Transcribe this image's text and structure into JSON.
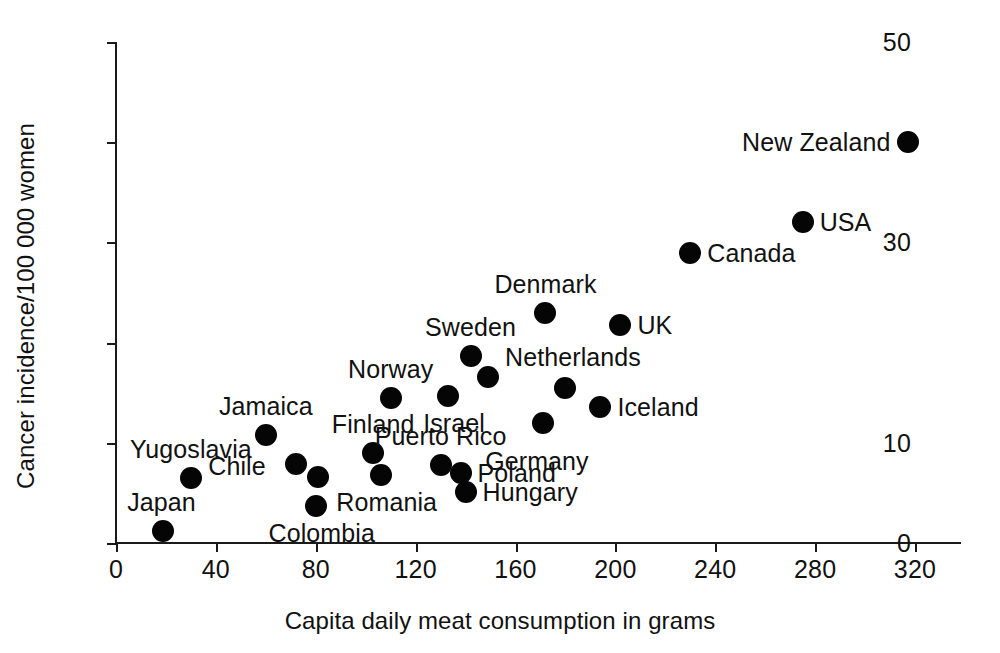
{
  "chart_data": {
    "type": "scatter",
    "title": "",
    "xlabel": "Capita daily meat consumption in grams",
    "ylabel": "Cancer incidence/100 000 women",
    "xlim": [
      0,
      330
    ],
    "ylim": [
      0,
      50
    ],
    "xticks": [
      0,
      40,
      80,
      120,
      160,
      200,
      240,
      280,
      320
    ],
    "xtick_labels": [
      "0",
      "40",
      "80",
      "120",
      "160",
      "200",
      "240",
      "280",
      "320"
    ],
    "yticks": [
      0,
      10,
      20,
      30,
      40,
      50
    ],
    "ytick_labels": [
      "0",
      "10",
      "",
      "30",
      "",
      "50"
    ],
    "grid": false,
    "legend": false,
    "marker": "filled-circle",
    "marker_color": "#050505",
    "axis_color": "#1a1a1a",
    "background": "#ffffff",
    "points": [
      {
        "label": "Japan",
        "x": 19,
        "y": 1.2,
        "label_pos": "above-left"
      },
      {
        "label": "Yugoslavia",
        "x": 30,
        "y": 6.5,
        "label_pos": "above"
      },
      {
        "label": "Jamaica",
        "x": 60,
        "y": 10.8,
        "label_pos": "above"
      },
      {
        "label": "Chile",
        "x": 72,
        "y": 7.9,
        "label_pos": "below-left"
      },
      {
        "label": "",
        "x": 81,
        "y": 6.6,
        "label_pos": "none"
      },
      {
        "label": "Colombia",
        "x": 80,
        "y": 3.7,
        "label_pos": "below"
      },
      {
        "label": "Finland",
        "x": 103,
        "y": 9.0,
        "label_pos": "above"
      },
      {
        "label": "Romania",
        "x": 106,
        "y": 6.8,
        "label_pos": "below"
      },
      {
        "label": "Norway",
        "x": 110,
        "y": 14.5,
        "label_pos": "above"
      },
      {
        "label": "Puerto Rico",
        "x": 130,
        "y": 7.8,
        "label_pos": "above"
      },
      {
        "label": "Israel",
        "x": 133,
        "y": 14.7,
        "label_pos": "below"
      },
      {
        "label": "Poland",
        "x": 138,
        "y": 7.0,
        "label_pos": "right"
      },
      {
        "label": "Hungary",
        "x": 140,
        "y": 5.1,
        "label_pos": "right"
      },
      {
        "label": "Sweden",
        "x": 142,
        "y": 18.7,
        "label_pos": "above"
      },
      {
        "label": "Netherlands",
        "x": 149,
        "y": 16.6,
        "label_pos": "right-up"
      },
      {
        "label": "Germany",
        "x": 171,
        "y": 12.0,
        "label_pos": "below-right"
      },
      {
        "label": "Denmark",
        "x": 172,
        "y": 23.0,
        "label_pos": "above"
      },
      {
        "label": "",
        "x": 180,
        "y": 15.5,
        "label_pos": "none"
      },
      {
        "label": "Iceland",
        "x": 194,
        "y": 13.6,
        "label_pos": "right"
      },
      {
        "label": "UK",
        "x": 202,
        "y": 21.8,
        "label_pos": "right"
      },
      {
        "label": "Canada",
        "x": 230,
        "y": 28.9,
        "label_pos": "right"
      },
      {
        "label": "USA",
        "x": 275,
        "y": 32.0,
        "label_pos": "right"
      },
      {
        "label": "New Zealand",
        "x": 317,
        "y": 40.0,
        "label_pos": "left"
      }
    ]
  }
}
